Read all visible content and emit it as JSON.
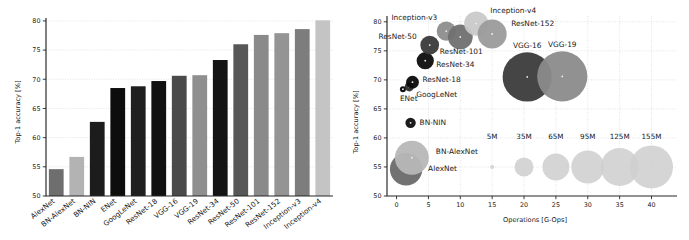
{
  "figure": {
    "name": "deep-neural-network-benchmark-figure",
    "background": "#ffffff"
  },
  "chart_data": [
    {
      "id": "top1-accuracy-bar-chart",
      "type": "bar",
      "title": "",
      "xlabel": "",
      "ylabel": "Top-1 accuracy [%]",
      "ylim": [
        50,
        80.5
      ],
      "yticks": [
        50,
        55,
        60,
        65,
        70,
        75,
        80
      ],
      "ytick_labels": [
        "50",
        "55",
        "60",
        "65",
        "70",
        "75",
        "80"
      ],
      "grid": true,
      "legend": "none",
      "categories": [
        "AlexNet",
        "BN-AlexNet",
        "BN-NIN",
        "ENet",
        "GoogLeNet",
        "ResNet-18",
        "VGG-16",
        "VGG-19",
        "ResNet-34",
        "ResNet-50",
        "ResNet-101",
        "ResNet-152",
        "Inception-v3",
        "Inception-v4"
      ],
      "values": [
        54.6,
        56.7,
        62.7,
        68.5,
        68.8,
        69.7,
        70.6,
        70.7,
        73.3,
        76.0,
        77.6,
        77.9,
        78.6,
        80.1
      ],
      "bar_colors": [
        "#6e6e6e",
        "#b3b3b3",
        "#1c1c1c",
        "#0d0d0d",
        "#1f1f1f",
        "#111111",
        "#4a4a4a",
        "#8f8f8f",
        "#141414",
        "#575757",
        "#8a8a8a",
        "#949494",
        "#7d7d7d",
        "#c4c4c4"
      ]
    },
    {
      "id": "accuracy-vs-operations-bubble-chart",
      "type": "scatter",
      "title": "",
      "xlabel": "Operations [G-Ops]",
      "ylabel": "Top-1 accuracy [%]",
      "xlim": [
        -1.5,
        44
      ],
      "ylim": [
        50,
        81
      ],
      "xticks": [
        0,
        5,
        10,
        15,
        20,
        25,
        30,
        35,
        40
      ],
      "xtick_labels": [
        "0",
        "5",
        "10",
        "15",
        "20",
        "25",
        "30",
        "35",
        "40"
      ],
      "yticks": [
        50,
        55,
        60,
        65,
        70,
        75,
        80
      ],
      "ytick_labels": [
        "50",
        "55",
        "60",
        "65",
        "70",
        "75",
        "80"
      ],
      "grid": true,
      "bubble_meaning": "bubble area is proportional to number of model parameters",
      "points": [
        {
          "label": "AlexNet",
          "x": 1.5,
          "y": 54.6,
          "params_m": 60,
          "r": 16.2,
          "color": "#6a6a6a",
          "label_dx": 22,
          "label_dy": 2,
          "anchor": "start"
        },
        {
          "label": "BN-AlexNet",
          "x": 2.4,
          "y": 56.6,
          "params_m": 63,
          "r": 17.0,
          "color": "#b7b7b7",
          "label_dx": 24,
          "label_dy": -4,
          "anchor": "start"
        },
        {
          "label": "BN-NIN",
          "x": 2.2,
          "y": 62.6,
          "params_m": 8,
          "r": 5.2,
          "color": "#101010",
          "label_dx": 9,
          "label_dy": 2.5,
          "anchor": "start"
        },
        {
          "label": "ENet",
          "x": 1.0,
          "y": 68.4,
          "params_m": 1,
          "r": 3.0,
          "color": "#050505",
          "label_dx": -3,
          "label_dy": 12,
          "anchor": "start"
        },
        {
          "label": "GoogLeNet",
          "x": 2.0,
          "y": 68.8,
          "params_m": 7,
          "r": 4.6,
          "color": "#2e2e2e",
          "label_dx": 7,
          "label_dy": 10,
          "anchor": "start"
        },
        {
          "label": "ResNet-18",
          "x": 2.5,
          "y": 69.6,
          "params_m": 12,
          "r": 6.4,
          "color": "#0a0a0a",
          "label_dx": 10,
          "label_dy": 0,
          "anchor": "start"
        },
        {
          "label": "ResNet-34",
          "x": 4.5,
          "y": 73.3,
          "params_m": 22,
          "r": 8.6,
          "color": "#0d0d0d",
          "label_dx": 11,
          "label_dy": 6,
          "anchor": "start"
        },
        {
          "label": "ResNet-50",
          "x": 5.2,
          "y": 76.0,
          "params_m": 26,
          "r": 9.4,
          "color": "#3a3a3a",
          "label_dx": -13,
          "label_dy": -6,
          "anchor": "end"
        },
        {
          "label": "Inception-v3",
          "x": 7.8,
          "y": 78.4,
          "params_m": 27,
          "r": 9.6,
          "color": "#8d8d8d",
          "label_dx": -9,
          "label_dy": -11,
          "anchor": "end"
        },
        {
          "label": "ResNet-101",
          "x": 10.0,
          "y": 77.4,
          "params_m": 45,
          "r": 12.4,
          "color": "#707070",
          "label_dx": 1,
          "label_dy": 17,
          "anchor": "middle"
        },
        {
          "label": "Inception-v4",
          "x": 12.5,
          "y": 79.7,
          "params_m": 43,
          "r": 12.1,
          "color": "#c9c9c9",
          "label_dx": 14,
          "label_dy": -11,
          "anchor": "start"
        },
        {
          "label": "ResNet-152",
          "x": 15.0,
          "y": 77.9,
          "params_m": 60,
          "r": 14.5,
          "color": "#9b9b9b",
          "label_dx": 19,
          "label_dy": -8,
          "anchor": "start"
        },
        {
          "label": "VGG-16",
          "x": 20.5,
          "y": 70.5,
          "params_m": 138,
          "r": 24.6,
          "color": "#3b3b3b",
          "label_dx": 0,
          "label_dy": -29,
          "anchor": "middle"
        },
        {
          "label": "VGG-19",
          "x": 26.0,
          "y": 70.6,
          "params_m": 144,
          "r": 25.1,
          "color": "#8b8b8b",
          "label_dx": 0,
          "label_dy": -29,
          "anchor": "middle"
        }
      ],
      "size_legend": {
        "y": 55,
        "color": "#cfcfcf",
        "entries": [
          {
            "label": "5M",
            "x": 15,
            "r": 2.0
          },
          {
            "label": "35M",
            "x": 20,
            "r": 9.5
          },
          {
            "label": "65M",
            "x": 25,
            "r": 13.5
          },
          {
            "label": "95M",
            "x": 30,
            "r": 16.5
          },
          {
            "label": "125M",
            "x": 35,
            "r": 19.0
          },
          {
            "label": "155M",
            "x": 40,
            "r": 21.5
          }
        ]
      }
    }
  ]
}
